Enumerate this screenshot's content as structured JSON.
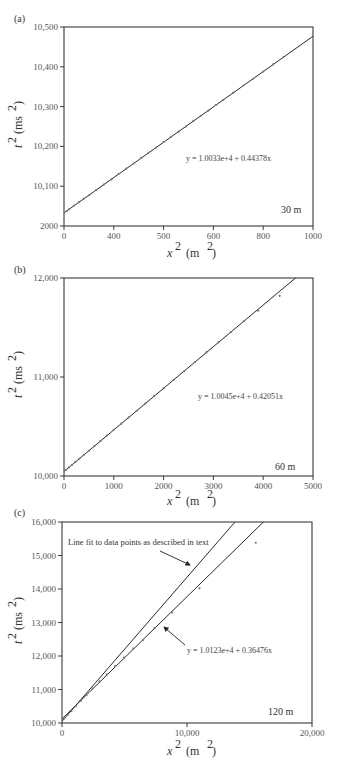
{
  "chart_data": [
    {
      "panel": "(a)",
      "type": "scatter",
      "title": "",
      "xlabel": "x² (m²)",
      "ylabel": "t² (ms²)",
      "xlim": [
        0,
        1000
      ],
      "ylim": [
        10000,
        10500
      ],
      "x_ticks": [
        "0",
        "400",
        "500",
        "600",
        "800",
        "1000"
      ],
      "y_ticks": [
        "2000",
        "10,100",
        "10,200",
        "10,300",
        "10,400",
        "10,500"
      ],
      "depth_label": "30 m",
      "fit": {
        "equation": "y = 1.0033e+4 + 0.44378x",
        "intercept": 10033,
        "slope": 0.44378
      },
      "series": [
        {
          "name": "data",
          "x": [
            0,
            10,
            20,
            40,
            60,
            80,
            100,
            130,
            160,
            190,
            220,
            250,
            280,
            310,
            340,
            370,
            400,
            430,
            460,
            490,
            520,
            550,
            580,
            610,
            640,
            680,
            720,
            760,
            800,
            840,
            880
          ],
          "y": [
            10033,
            10037,
            10042,
            10051,
            10060,
            10069,
            10077,
            10091,
            10104,
            10117,
            10131,
            10144,
            10157,
            10171,
            10184,
            10197,
            10211,
            10224,
            10237,
            10250,
            10264,
            10277,
            10290,
            10304,
            10317,
            10335,
            10353,
            10370,
            10388,
            10406,
            10424
          ]
        }
      ],
      "grid": false
    },
    {
      "panel": "(b)",
      "type": "scatter",
      "title": "",
      "xlabel": "x² (m²)",
      "ylabel": "t² (ms²)",
      "xlim": [
        0,
        5000
      ],
      "ylim": [
        10000,
        12000
      ],
      "x_ticks": [
        "0",
        "1000",
        "2000",
        "3000",
        "4000",
        "5000"
      ],
      "y_ticks": [
        "10,000",
        "11,000",
        "12,000"
      ],
      "depth_label": "60 m",
      "fit": {
        "equation": "y = 1.0045e+4 + 0.42051x",
        "intercept": 10045,
        "slope": 0.42051
      },
      "series": [
        {
          "name": "data",
          "x": [
            0,
            40,
            100,
            160,
            230,
            310,
            400,
            500,
            610,
            730,
            860,
            1000,
            1150,
            1300,
            1460,
            1630,
            1810,
            2000,
            2200,
            2410,
            2630,
            2860,
            3100,
            3350,
            3610,
            3900,
            4330
          ],
          "y": [
            10045,
            10062,
            10087,
            10112,
            10142,
            10175,
            10213,
            10255,
            10302,
            10352,
            10407,
            10466,
            10529,
            10592,
            10659,
            10731,
            10806,
            10886,
            10970,
            11058,
            11151,
            11248,
            11349,
            11454,
            11563,
            11670,
            11820
          ]
        }
      ],
      "grid": false
    },
    {
      "panel": "(c)",
      "type": "scatter",
      "title": "",
      "xlabel": "x² (m²)",
      "ylabel": "t² (ms²)",
      "xlim": [
        0,
        20000
      ],
      "ylim": [
        10000,
        16000
      ],
      "x_ticks": [
        "0",
        "10,000",
        "20,000"
      ],
      "y_ticks": [
        "10,000",
        "11,000",
        "12,000",
        "13,000",
        "14,000",
        "15,000",
        "16,000"
      ],
      "depth_label": "120 m",
      "fit": {
        "equation": "y = 1.0123e+4 + 0.36476x",
        "intercept": 10123,
        "slope": 0.36476
      },
      "reference_line": {
        "label": "Line fit to data points as described in text",
        "intercept": 10050,
        "slope": 0.43
      },
      "series": [
        {
          "name": "data",
          "x": [
            0,
            200,
            450,
            750,
            1100,
            1500,
            1950,
            2450,
            3000,
            3600,
            4250,
            4950,
            5700,
            6500,
            7400,
            8800,
            11000,
            15500
          ],
          "y": [
            10050,
            10135,
            10240,
            10360,
            10500,
            10660,
            10830,
            11030,
            11240,
            11450,
            11700,
            11950,
            12220,
            12480,
            12830,
            13300,
            14020,
            15380
          ]
        }
      ],
      "grid": false
    }
  ],
  "panels": [
    {
      "label": "(a)",
      "y_axis_title": "t",
      "y_axis_unit": "(ms",
      "x_axis_title": "x",
      "x_axis_unit": "(m",
      "equation": "y = 1.0033e+4 + 0.44378x",
      "depth": "30 m",
      "x_ticks": [
        "0",
        "400",
        "500",
        "600",
        "800",
        "1000"
      ],
      "y_ticks": [
        "2000",
        "10,100",
        "10,200",
        "10,300",
        "10,400",
        "10,500"
      ]
    },
    {
      "label": "(b)",
      "y_axis_title": "t",
      "y_axis_unit": "(ms",
      "x_axis_title": "x",
      "x_axis_unit": "(m",
      "equation": "y = 1.0045e+4 + 0.42051x",
      "depth": "60 m",
      "x_ticks": [
        "0",
        "1000",
        "2000",
        "3000",
        "4000",
        "5000"
      ],
      "y_ticks": [
        "10,000",
        "11,000",
        "12,000"
      ]
    },
    {
      "label": "(c)",
      "y_axis_title": "t",
      "y_axis_unit": "(ms",
      "x_axis_title": "x",
      "x_axis_unit": "(m",
      "equation": "y = 1.0123e+4 + 0.36476x",
      "annotation": "Line fit to data points as described in text",
      "depth": "120 m",
      "x_ticks": [
        "0",
        "10,000",
        "20,000"
      ],
      "y_ticks": [
        "10,000",
        "11,000",
        "12,000",
        "13,000",
        "14,000",
        "15,000",
        "16,000"
      ]
    }
  ],
  "colors": {
    "frame": "#3a3a3a",
    "line": "#2a2a2a",
    "marker": "#777777",
    "text": "#444444"
  }
}
